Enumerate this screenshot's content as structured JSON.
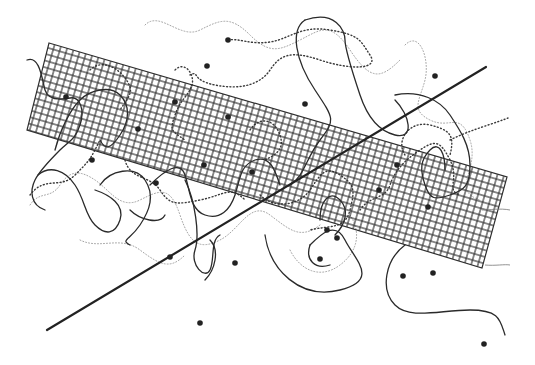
{
  "artwork": {
    "width": 535,
    "height": 365,
    "background": "#ffffff",
    "ink_color": "#222222",
    "grid_band": {
      "corners": [
        [
          49,
          43
        ],
        [
          507,
          177
        ],
        [
          482,
          268
        ],
        [
          27,
          130
        ]
      ],
      "cell_size": 6.5,
      "stroke": "#2f2f2f"
    },
    "straight_line": {
      "x1": 47,
      "y1": 330,
      "x2": 486,
      "y2": 67
    },
    "dots": [
      [
        228,
        40
      ],
      [
        207,
        66
      ],
      [
        435,
        76
      ],
      [
        66,
        97
      ],
      [
        175,
        102
      ],
      [
        305,
        104
      ],
      [
        228,
        117
      ],
      [
        138,
        129
      ],
      [
        92,
        160
      ],
      [
        204,
        165
      ],
      [
        397,
        165
      ],
      [
        252,
        172
      ],
      [
        156,
        183
      ],
      [
        379,
        190
      ],
      [
        428,
        207
      ],
      [
        327,
        230
      ],
      [
        337,
        238
      ],
      [
        320,
        259
      ],
      [
        235,
        263
      ],
      [
        170,
        257
      ],
      [
        403,
        276
      ],
      [
        433,
        273
      ],
      [
        200,
        323
      ],
      [
        484,
        344
      ]
    ]
  }
}
